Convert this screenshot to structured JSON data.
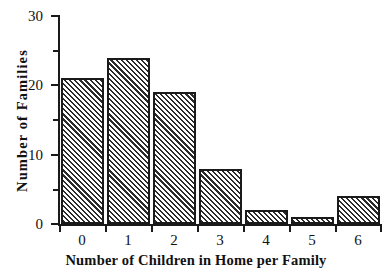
{
  "chart_data": {
    "type": "bar",
    "title": "",
    "subtitle": "",
    "xlabel": "Number of Children in Home per Family",
    "ylabel": "Number  of  Families",
    "categories": [
      "0",
      "1",
      "2",
      "3",
      "4",
      "5",
      "6"
    ],
    "values": [
      21,
      24,
      19,
      8,
      2,
      1,
      4
    ],
    "series": [
      {
        "name": "Number of Families",
        "values": [
          21,
          24,
          19,
          8,
          2,
          1,
          4
        ]
      }
    ],
    "xlim": [
      -0.5,
      6.5
    ],
    "ylim": [
      0,
      30
    ],
    "y_ticks_major": [
      "0",
      "10",
      "20",
      "30"
    ],
    "y_ticks_major_values": [
      0,
      10,
      20,
      30
    ],
    "y_ticks_minor_values": [
      5,
      15,
      25
    ],
    "grid": false,
    "legend": null,
    "legend_position": "none",
    "annotations": [],
    "bar_fill": "diagonal-hatch",
    "bar_edge_color": "#1a1a1a",
    "background_color": "#ffffff"
  },
  "axes": {
    "y_tick_labels": [
      "30",
      "20",
      "10",
      "0"
    ],
    "x_tick_labels": [
      "0",
      "1",
      "2",
      "3",
      "4",
      "5",
      "6"
    ],
    "x_title": "Number of Children in Home per Family",
    "y_title": "Number  of  Families"
  }
}
